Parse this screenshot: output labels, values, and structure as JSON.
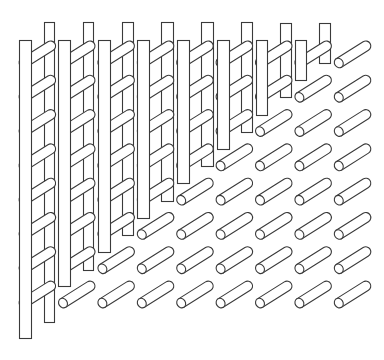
{
  "figure": {
    "stroke_color": "#3a3a3a",
    "background": "#ffffff"
  },
  "grid": {
    "origin_x": 23.6,
    "origin_y": 63,
    "col_step": 39.4,
    "row_step": 34.3,
    "columns": 9,
    "rows": 8,
    "cylinder": {
      "dx": 27,
      "dy": -17,
      "radius": 5
    }
  },
  "front_bars": [
    {
      "x": 19,
      "top": 40,
      "bottom": 338,
      "width": 12
    },
    {
      "x": 58,
      "top": 40,
      "bottom": 286,
      "width": 12
    },
    {
      "x": 98,
      "top": 40,
      "bottom": 252,
      "width": 12
    },
    {
      "x": 137,
      "top": 40,
      "bottom": 218,
      "width": 12
    },
    {
      "x": 177,
      "top": 40,
      "bottom": 183,
      "width": 12
    },
    {
      "x": 217,
      "top": 40,
      "bottom": 149,
      "width": 12
    },
    {
      "x": 256,
      "top": 40,
      "bottom": 115,
      "width": 11
    },
    {
      "x": 295,
      "top": 40,
      "bottom": 80,
      "width": 11
    }
  ],
  "back_bars": [
    {
      "x": 44,
      "top": 22,
      "bottom": 322,
      "width": 10
    },
    {
      "x": 83,
      "top": 22,
      "bottom": 270,
      "width": 10
    },
    {
      "x": 122,
      "top": 22,
      "bottom": 235,
      "width": 11
    },
    {
      "x": 161,
      "top": 22,
      "bottom": 201,
      "width": 12
    },
    {
      "x": 201,
      "top": 22,
      "bottom": 166,
      "width": 12
    },
    {
      "x": 241,
      "top": 22,
      "bottom": 132,
      "width": 11
    },
    {
      "x": 280,
      "top": 23,
      "bottom": 97,
      "width": 11
    },
    {
      "x": 319,
      "top": 23,
      "bottom": 63,
      "width": 11
    }
  ]
}
